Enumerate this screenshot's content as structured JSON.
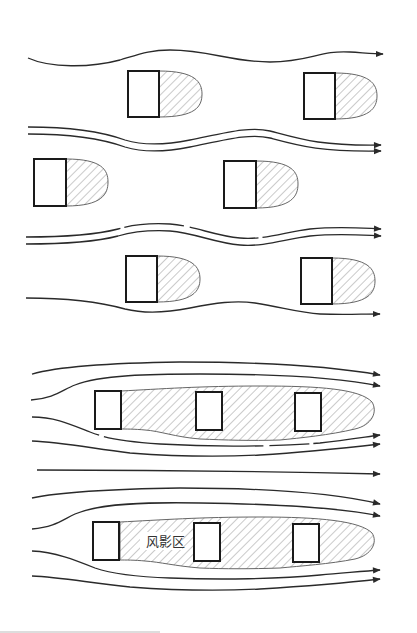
{
  "diagram": {
    "type": "airflow-around-buildings",
    "panels": [
      {
        "id": "staggered-layout",
        "description": "Staggered (offset) building arrangement; each building has its own small wind-shadow wake",
        "rows": 3,
        "buildings_per_row": [
          2,
          2,
          2
        ],
        "streamlines": 7
      },
      {
        "id": "aligned-layout",
        "description": "Aligned (in-line) building arrangement; buildings in a row share one long continuous wind-shadow zone",
        "rows": 2,
        "buildings_per_row": [
          3,
          3
        ],
        "streamlines": 9
      }
    ],
    "labels": {
      "shadow_zone": "风影区"
    },
    "colors": {
      "line": "#2a2a2a",
      "building_stroke": "#1a1a1a",
      "hatch": "#888888",
      "background": "#ffffff"
    }
  }
}
